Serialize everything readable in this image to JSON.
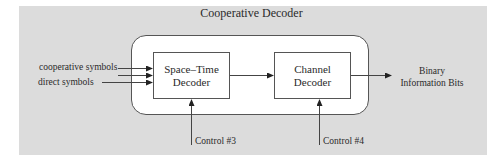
{
  "diagram": {
    "title": "Cooperative Decoder",
    "inputs": [
      {
        "label": "cooperative symbols"
      },
      {
        "label": ""
      },
      {
        "label": "direct symbols"
      }
    ],
    "blocks": [
      {
        "id": "space-time-decoder",
        "line1": "Space–Time",
        "line2": "Decoder"
      },
      {
        "id": "channel-decoder",
        "line1": "Channel",
        "line2": "Decoder"
      }
    ],
    "output": {
      "line1": "Binary",
      "line2": "Information Bits"
    },
    "controls": [
      {
        "label": "Control #3",
        "target": "space-time-decoder"
      },
      {
        "label": "Control #4",
        "target": "channel-decoder"
      }
    ],
    "colors": {
      "panel_background": "#dcdcdc",
      "container_background": "#ffffff",
      "line": "#444444"
    }
  }
}
